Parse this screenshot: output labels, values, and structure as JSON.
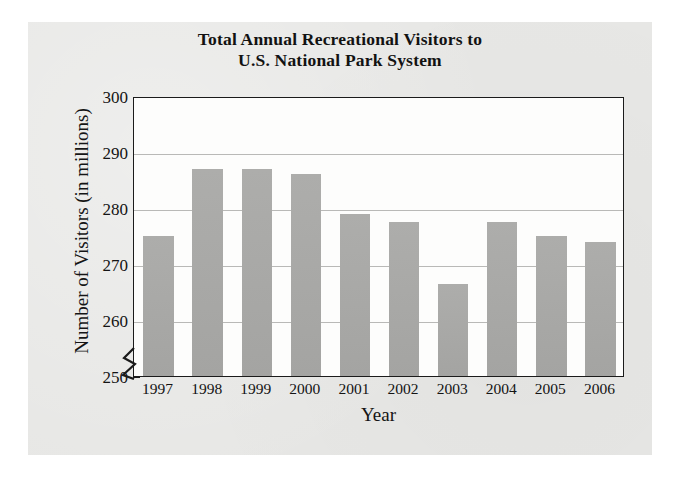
{
  "chart_data": {
    "type": "bar",
    "title": "Total Annual Recreational Visitors to U.S. National Park System",
    "title_line1": "Total Annual Recreational Visitors to",
    "title_line2": "U.S. National Park System",
    "xlabel": "Year",
    "ylabel": "Number of Visitors (in millions)",
    "categories": [
      "1997",
      "1998",
      "1999",
      "2000",
      "2001",
      "2002",
      "2003",
      "2004",
      "2005",
      "2006"
    ],
    "values": [
      275,
      287,
      287,
      286,
      279,
      277.5,
      266.5,
      277.5,
      275,
      274
    ],
    "ylim": [
      250,
      300
    ],
    "y_ticks": [
      300,
      290,
      280,
      270,
      260,
      250
    ],
    "y_tick_labels": [
      "300",
      "290",
      "280",
      "270",
      "260",
      "250"
    ],
    "grid": true,
    "axis_break": "y-axis break below 250",
    "legend": "none",
    "bar_color": "#a9a9a7",
    "plot_background": "#fdfdfc",
    "frame_color": "#1b1b1b",
    "gridline_color": "#b9b9b7",
    "page_background": "#e7e7e5"
  }
}
